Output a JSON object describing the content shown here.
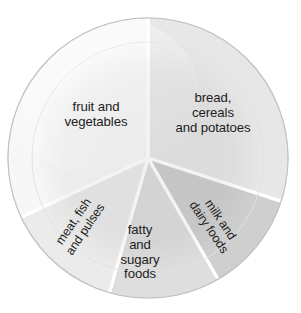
{
  "figure": {
    "name": "eatwell-plate"
  },
  "chart_data": {
    "type": "pie",
    "title": "",
    "subtitle": "",
    "xlabel": "",
    "ylabel": "",
    "legend_position": "none",
    "grid": false,
    "labels_on_slices": true,
    "center": {
      "x": 148,
      "y": 158
    },
    "radius": 140,
    "start_angle_deg": 0,
    "direction": "clockwise",
    "categories": [
      "bread, cereals and potatoes",
      "milk and dairy foods",
      "fatty and sugary foods",
      "meat, fish and pulses",
      "fruit and vegetables"
    ],
    "values": [
      30,
      12,
      13,
      14,
      31
    ],
    "angles_deg": [
      108,
      42,
      46,
      49,
      115
    ],
    "slices": [
      {
        "key": "bread",
        "label": "bread,\ncereals\nand potatoes",
        "value": 30,
        "start_deg": 0,
        "end_deg": 108,
        "color": "#e7e7e7"
      },
      {
        "key": "milk",
        "label": "milk and\ndairy foods",
        "value": 12,
        "start_deg": 108,
        "end_deg": 150,
        "color": "#cfcfcf"
      },
      {
        "key": "fatty",
        "label": "fatty\nand\nsugary\nfoods",
        "value": 13,
        "start_deg": 150,
        "end_deg": 196,
        "color": "#dedede"
      },
      {
        "key": "meat",
        "label": "meat, fish\nand pulses",
        "value": 14,
        "start_deg": 196,
        "end_deg": 245,
        "color": "#ebebeb"
      },
      {
        "key": "fruit",
        "label": "fruit and\nvegetables",
        "value": 31,
        "start_deg": 245,
        "end_deg": 360,
        "color": "#f7f7f7"
      }
    ]
  },
  "plate": {
    "rim_color": "#c9c9c9",
    "rim_fill": "#fbfbfb",
    "inner_ring_color": "#e3e3e3",
    "divider_color": "#ffffff",
    "background": "#ffffff",
    "text_color": "#1c1c1c"
  },
  "labels": {
    "fruit_and_vegetables": "fruit and\nvegetables",
    "bread_cereals_and_potatoes": "bread,\ncereals\nand potatoes",
    "fatty_and_sugary_foods": "fatty\nand\nsugary\nfoods",
    "meat_fish_and_pulses": "meat, fish\nand pulses",
    "milk_and_dairy_foods": "milk and\ndairy foods"
  }
}
